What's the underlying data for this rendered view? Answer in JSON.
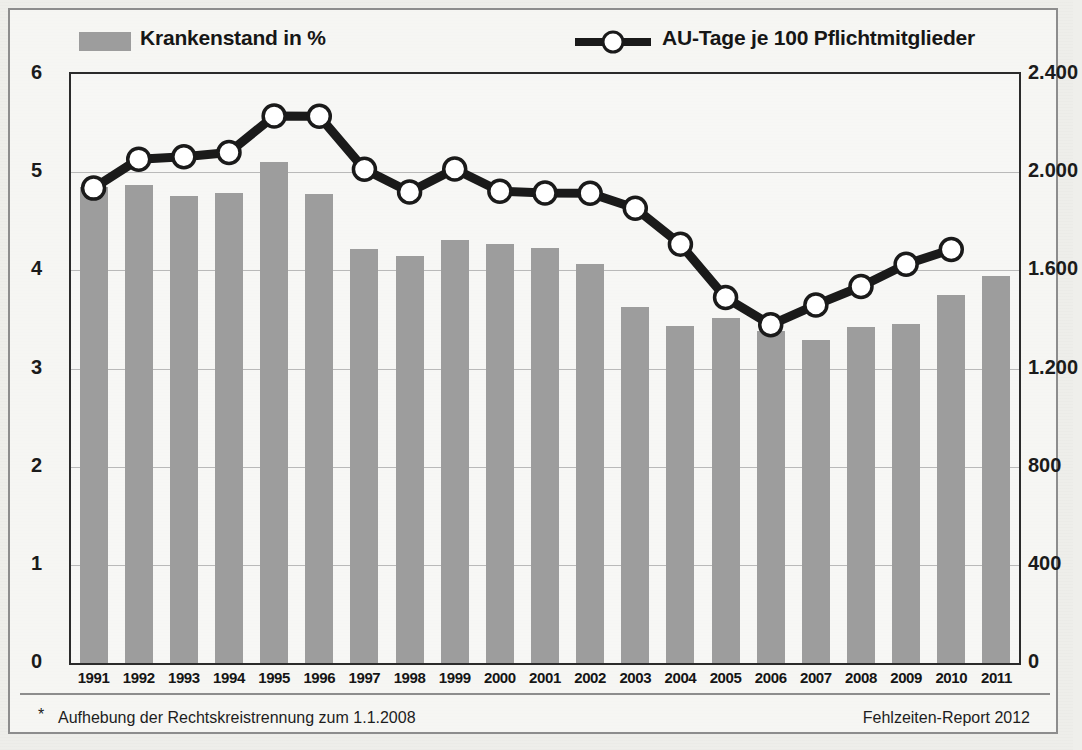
{
  "legend": {
    "bar_series_label": "Krankenstand in %",
    "line_series_label": "AU-Tage je 100 Pflichtmitglieder",
    "bar_color": "#9d9d9d",
    "line_color": "#1a1a1a"
  },
  "footer": {
    "star": "*",
    "note": "Aufhebung der Rechtskreistrennung zum 1.1.2008",
    "source": "Fehlzeiten-Report 2012"
  },
  "chart_data": {
    "type": "bar",
    "title": "",
    "xlabel": "",
    "ylabel": "",
    "grid": true,
    "legend_position": "top",
    "categories": [
      "1991",
      "1992",
      "1993",
      "1994",
      "1995",
      "1996",
      "1997",
      "1998",
      "1999",
      "2000",
      "2001",
      "2002",
      "2003",
      "2004",
      "2005",
      "2006",
      "2007",
      "2008",
      "2009",
      "2010",
      "2011"
    ],
    "left_axis": {
      "label": "Krankenstand in %",
      "ylim": [
        0,
        6
      ],
      "ticks": [
        "0",
        "1",
        "2",
        "3",
        "4",
        "5",
        "6"
      ],
      "tick_values": [
        0,
        1,
        2,
        3,
        4,
        5,
        6
      ]
    },
    "right_axis": {
      "label": "AU-Tage je 100 Pflichtmitglieder",
      "ylim": [
        0,
        2400
      ],
      "ticks": [
        "0",
        "400",
        "800",
        "1.200",
        "1.600",
        "2.000",
        "2.400"
      ],
      "tick_values": [
        0,
        400,
        800,
        1200,
        1600,
        2000,
        2400
      ]
    },
    "series": [
      {
        "name": "Krankenstand in %",
        "type": "bar",
        "axis": "left",
        "values": [
          4.85,
          4.87,
          4.76,
          4.79,
          5.1,
          4.78,
          4.22,
          4.15,
          4.31,
          4.27,
          4.23,
          4.06,
          3.63,
          3.43,
          3.51,
          3.38,
          3.29,
          3.42,
          3.45,
          3.75,
          3.94
        ]
      },
      {
        "name": "AU-Tage je 100 Pflichtmitglieder",
        "type": "line",
        "axis": "right",
        "values": [
          1935,
          2053,
          2063,
          2080,
          2229,
          2228,
          2012,
          1919,
          2013,
          1922,
          1915,
          1914,
          1853,
          1706,
          1489,
          1378,
          1459,
          1534,
          1625,
          1685,
          null
        ]
      }
    ]
  }
}
